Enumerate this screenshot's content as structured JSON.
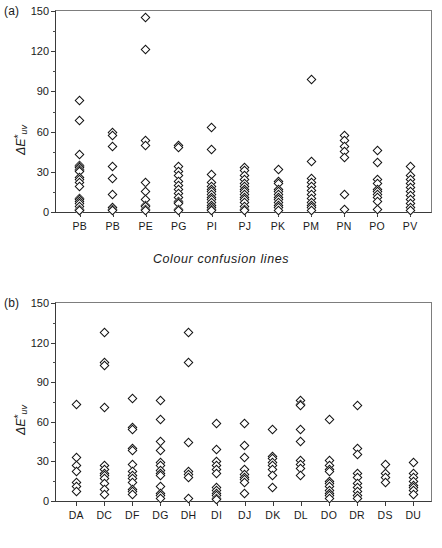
{
  "figure": {
    "panel_a_label": "(a)",
    "panel_b_label": "(b)",
    "caption_a": "Colour  confusion  lines",
    "caption_b": "Colour  confusion  lines"
  },
  "chart_data": [
    {
      "type": "scatter",
      "panel": "(a)",
      "title": "",
      "xlabel": "Colour  confusion  lines",
      "ylabel": "ΔE*uv",
      "ylim": [
        0,
        150
      ],
      "yticks": [
        0,
        30,
        60,
        90,
        120,
        150
      ],
      "yminor": [
        15,
        45,
        75,
        105,
        135
      ],
      "grid": false,
      "legend": "none",
      "categories": [
        "PB",
        "PB",
        "PE",
        "PG",
        "PI",
        "PJ",
        "PK",
        "PM",
        "PN",
        "PO",
        "PV"
      ],
      "series": [
        {
          "name": "PB",
          "values": [
            83,
            68,
            43,
            35,
            34,
            33,
            32,
            31,
            30,
            26,
            24,
            22,
            19,
            10,
            9,
            8,
            6,
            4,
            2,
            1,
            1
          ]
        },
        {
          "name": "PB",
          "values": [
            59,
            57,
            49,
            34,
            25,
            13,
            3,
            2,
            1
          ]
        },
        {
          "name": "PE",
          "values": [
            145,
            121,
            53,
            50,
            22,
            15,
            9,
            5,
            4,
            2,
            1
          ]
        },
        {
          "name": "PG",
          "values": [
            50,
            48,
            34,
            30,
            27,
            23,
            20,
            17,
            14,
            11,
            8,
            7,
            6,
            2,
            1
          ]
        },
        {
          "name": "PI",
          "values": [
            63,
            47,
            28,
            22,
            19,
            17,
            15,
            13,
            11,
            9,
            7,
            5,
            3,
            2,
            1
          ]
        },
        {
          "name": "PJ",
          "values": [
            33,
            31,
            27,
            24,
            21,
            19,
            17,
            15,
            13,
            11,
            9,
            7,
            4,
            2,
            1
          ]
        },
        {
          "name": "PK",
          "values": [
            32,
            23,
            21,
            17,
            15,
            13,
            11,
            9,
            7,
            5,
            3,
            1
          ]
        },
        {
          "name": "PM",
          "values": [
            99,
            38,
            25,
            22,
            19,
            16,
            13,
            10,
            7,
            5,
            3,
            1
          ]
        },
        {
          "name": "PN",
          "values": [
            57,
            53,
            49,
            45,
            41,
            13,
            2
          ]
        },
        {
          "name": "PO",
          "values": [
            46,
            37,
            24,
            21,
            17,
            15,
            13,
            11,
            8,
            2
          ]
        },
        {
          "name": "PV",
          "values": [
            34,
            27,
            24,
            21,
            18,
            15,
            12,
            9,
            6,
            3,
            1
          ]
        }
      ]
    },
    {
      "type": "scatter",
      "panel": "(b)",
      "title": "",
      "xlabel": "Colour  confusion  lines",
      "ylabel": "ΔE*uv",
      "ylim": [
        0,
        150
      ],
      "yticks": [
        0,
        30,
        60,
        90,
        120,
        150
      ],
      "yminor": [
        15,
        45,
        75,
        105,
        135
      ],
      "grid": false,
      "legend": "none",
      "categories": [
        "DA",
        "DC",
        "DF",
        "DG",
        "DH",
        "DI",
        "DJ",
        "DK",
        "DL",
        "DO",
        "DR",
        "DS",
        "DU"
      ],
      "series": [
        {
          "name": "DA",
          "values": [
            73,
            33,
            27,
            22,
            14,
            11,
            7
          ]
        },
        {
          "name": "DC",
          "values": [
            128,
            105,
            103,
            71,
            27,
            24,
            21,
            19,
            17,
            13,
            9,
            5
          ]
        },
        {
          "name": "DF",
          "values": [
            78,
            56,
            54,
            40,
            38,
            28,
            22,
            19,
            17,
            14,
            9,
            7,
            5
          ]
        },
        {
          "name": "DG",
          "values": [
            76,
            62,
            45,
            38,
            29,
            27,
            23,
            21,
            19,
            11,
            6,
            4,
            2
          ]
        },
        {
          "name": "DH",
          "values": [
            128,
            105,
            44,
            22,
            20,
            18,
            2
          ]
        },
        {
          "name": "DI",
          "values": [
            59,
            39,
            30,
            27,
            24,
            21,
            10,
            8,
            6,
            4,
            2,
            1
          ]
        },
        {
          "name": "DJ",
          "values": [
            59,
            42,
            33,
            24,
            20,
            18,
            16,
            14,
            6
          ]
        },
        {
          "name": "DK",
          "values": [
            54,
            34,
            32,
            29,
            27,
            24,
            19,
            10
          ]
        },
        {
          "name": "DL",
          "values": [
            76,
            73,
            72,
            54,
            45,
            31,
            28,
            25,
            19
          ]
        },
        {
          "name": "DO",
          "values": [
            62,
            31,
            27,
            24,
            22,
            15,
            13,
            11,
            8,
            6,
            4,
            2
          ]
        },
        {
          "name": "DR",
          "values": [
            72,
            40,
            35,
            21,
            18,
            13,
            10,
            7,
            4,
            2
          ]
        },
        {
          "name": "DS",
          "values": [
            28,
            21,
            18,
            14
          ]
        },
        {
          "name": "DU",
          "values": [
            29,
            21,
            18,
            15,
            12,
            10,
            8,
            5
          ]
        }
      ]
    }
  ]
}
